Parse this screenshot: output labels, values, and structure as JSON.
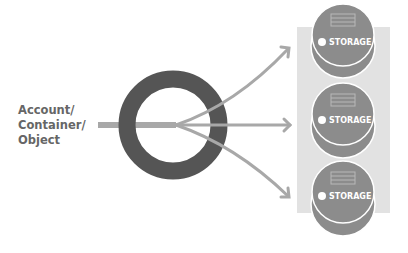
{
  "source_label": [
    "Account/",
    "Container/",
    "Object"
  ],
  "storage_nodes": [
    {
      "label": "STORAGE"
    },
    {
      "label": "STORAGE"
    },
    {
      "label": "STORAGE"
    }
  ],
  "colors": {
    "ring": "#555555",
    "arrow": "#a8a8a8",
    "panel": "#e2e2e2",
    "disk": "#8c8c8c",
    "text": "#666666"
  }
}
